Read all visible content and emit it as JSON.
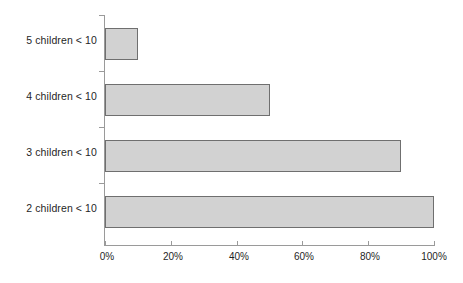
{
  "chart_data": {
    "type": "bar",
    "orientation": "horizontal",
    "title": "",
    "subtitle": "",
    "xlabel": "",
    "ylabel": "",
    "categories": [
      "5 children < 10",
      "4 children < 10",
      "3 children < 10",
      "2 children < 10"
    ],
    "values": [
      10,
      50,
      90,
      100
    ],
    "value_unit": "%",
    "xlim": [
      0,
      100
    ],
    "xticks": [
      0,
      20,
      40,
      60,
      80,
      100
    ],
    "xtick_labels": [
      "0%",
      "20%",
      "40%",
      "60%",
      "80%",
      "100%"
    ],
    "grid": false,
    "legend": false,
    "legend_position": "none",
    "series": [
      {
        "name": "",
        "values": [
          10,
          50,
          90,
          100
        ]
      }
    ],
    "colors": {
      "bar_fill": "#d2d2d2",
      "bar_border": "#6f6f6f",
      "axis": "#9a9a9a",
      "text": "#1f1f1f",
      "background": "#ffffff"
    }
  }
}
